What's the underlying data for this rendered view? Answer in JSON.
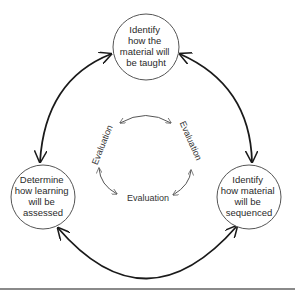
{
  "diagram": {
    "nodes": [
      {
        "id": "top",
        "lines": [
          "Identify",
          "how the",
          "material will",
          "be taught"
        ]
      },
      {
        "id": "left",
        "lines": [
          "Determine",
          "how learning",
          "will be",
          "assessed"
        ]
      },
      {
        "id": "right",
        "lines": [
          "Identify",
          "how material",
          "will be",
          "sequenced"
        ]
      }
    ],
    "inner_cycle": {
      "labels": [
        "Evaluation",
        "Evaluation",
        "Evaluation"
      ]
    },
    "colors": {
      "stroke": "#1a1a1a",
      "circle": "#555555",
      "thin_arrow": "#555555",
      "rule": "#8a8a8a"
    }
  }
}
